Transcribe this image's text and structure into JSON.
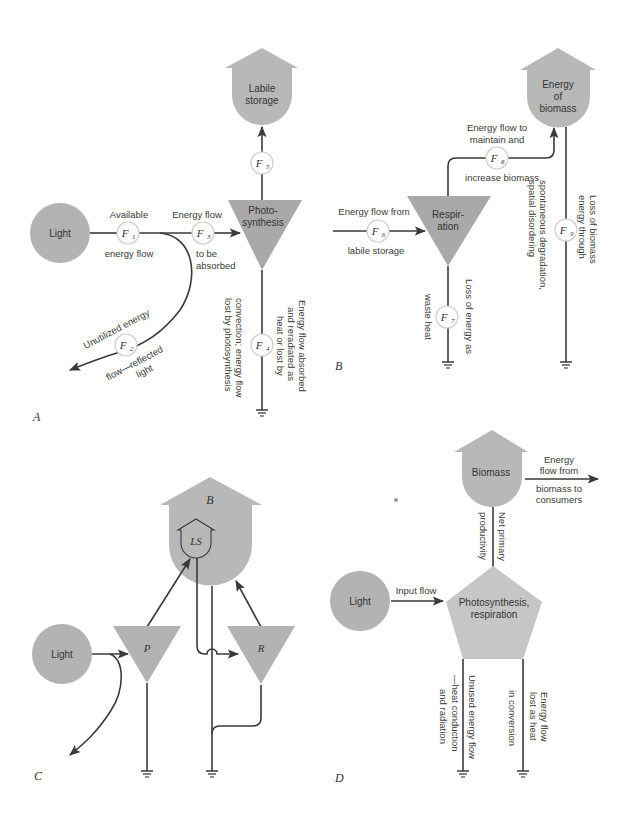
{
  "colors": {
    "source_fill": "#b3b3b3",
    "storage_fill": "#b8b8b8",
    "triangle_fill": "#a9a9a9",
    "pentagon_fill": "#c6c6c6",
    "line": "#3a3a3a"
  },
  "panel_a": {
    "panel_label": "A",
    "light": "Light",
    "storage": [
      "Labile",
      "storage"
    ],
    "process": [
      "Photo-",
      "synthesis"
    ],
    "flows": {
      "f1": {
        "sym": "F",
        "sub": "1",
        "above": "Available",
        "below": "energy flow"
      },
      "f2": {
        "sym": "F",
        "sub": "2",
        "above": "Unutilized energy",
        "below1": "flow—reflected",
        "below2": "light"
      },
      "f3": {
        "sym": "F",
        "sub": "3",
        "above": "Energy flow",
        "below1": "to be",
        "below2": "absorbed"
      },
      "f4": {
        "sym": "F",
        "sub": "4",
        "right1": "Energy flow absorbed",
        "right2": "and reradiated as",
        "right3": "heat or lost by",
        "left1": "convection; energy flow",
        "left2": "lost by photosynthesis"
      },
      "f5": {
        "sym": "F",
        "sub": "5"
      }
    }
  },
  "panel_b": {
    "panel_label": "B",
    "storage": [
      "Energy",
      "of",
      "biomass"
    ],
    "process": [
      "Respir-",
      "ation"
    ],
    "flows": {
      "f6": {
        "sym": "F",
        "sub": "6",
        "above": "Energy flow from",
        "below": "labile storage"
      },
      "f7": {
        "sym": "F",
        "sub": "7",
        "right": "Loss of energy as",
        "left": "waste heat"
      },
      "f8": {
        "sym": "F",
        "sub": "8",
        "above1": "Energy flow to",
        "above2": "maintain and",
        "below": "increase biomass"
      },
      "f9": {
        "sym": "F",
        "sub": "9",
        "right1": "Loss of biomass",
        "right2": "energy through",
        "left1": "spontaneous degradation,",
        "left2": "spatial disordering"
      }
    }
  },
  "panel_c": {
    "panel_label": "C",
    "light": "Light",
    "biomass": "B",
    "labile_storage": "LS",
    "photosynthesis": "P",
    "respiration": "R"
  },
  "panel_d": {
    "panel_label": "D",
    "light": "Light",
    "input_flow": "Input flow",
    "biomass": "Biomass",
    "process": [
      "Photosynthesis,",
      "respiration"
    ],
    "consumer_flow": [
      "Energy",
      "flow from",
      "biomass to",
      "consumers"
    ],
    "net_primary": [
      "Net primary",
      "productivity"
    ],
    "unused_flow": [
      "Unused energy flow",
      "—heat conduction",
      "and radiation"
    ],
    "heat_loss": [
      "Energy flow",
      "lost as heat",
      "in conversion"
    ]
  }
}
